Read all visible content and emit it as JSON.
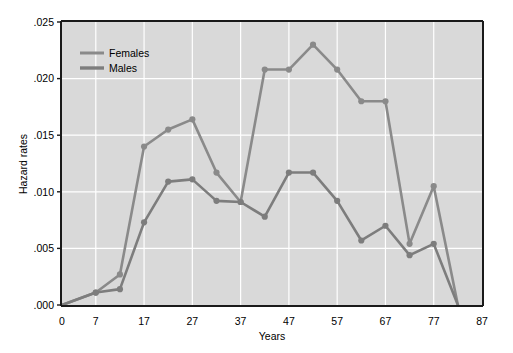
{
  "chart_data": {
    "type": "line",
    "title": "",
    "xlabel": "Years",
    "ylabel": "Hazard rates",
    "xlim": [
      0,
      87
    ],
    "ylim": [
      0,
      0.025
    ],
    "xticks": [
      0,
      7,
      17,
      27,
      37,
      47,
      57,
      67,
      77,
      87
    ],
    "xtick_labels": [
      "0",
      "7",
      "17",
      "27",
      "37",
      "47",
      "57",
      "67",
      "77",
      "87"
    ],
    "yticks": [
      0,
      0.005,
      0.01,
      0.015,
      0.02,
      0.025
    ],
    "ytick_labels": [
      ".000",
      ".005",
      ".010",
      ".015",
      ".020",
      ".025"
    ],
    "grid": true,
    "grid_color": "#ffffff",
    "plot_bg": "#d9d9d9",
    "figure_bg": "#ffffff",
    "legend_position": "upper-left",
    "series": [
      {
        "name": "Females",
        "color": "#8a8a8a",
        "marker": "circle",
        "x": [
          0,
          7,
          12,
          17,
          22,
          27,
          32,
          37,
          42,
          47,
          52,
          57,
          62,
          67,
          72,
          77,
          82
        ],
        "values": [
          0.0,
          0.0011,
          0.0027,
          0.014,
          0.0155,
          0.0164,
          0.0117,
          0.0091,
          0.0208,
          0.0208,
          0.023,
          0.0208,
          0.018,
          0.018,
          0.0054,
          0.0105,
          0.0
        ]
      },
      {
        "name": "Males",
        "color": "#7d7d7d",
        "marker": "circle",
        "x": [
          0,
          7,
          12,
          17,
          22,
          27,
          32,
          37,
          42,
          47,
          52,
          57,
          62,
          67,
          72,
          77,
          82
        ],
        "values": [
          0.0,
          0.0011,
          0.0014,
          0.0073,
          0.0109,
          0.0111,
          0.0092,
          0.0091,
          0.0078,
          0.0117,
          0.0117,
          0.0092,
          0.0057,
          0.007,
          0.0044,
          0.0054,
          0.0
        ]
      }
    ],
    "legend": [
      {
        "label": "Females",
        "color": "#8a8a8a"
      },
      {
        "label": "Males",
        "color": "#7d7d7d"
      }
    ]
  }
}
